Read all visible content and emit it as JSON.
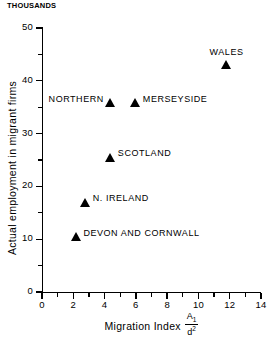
{
  "chart_data": {
    "type": "scatter",
    "title": "",
    "units_caption": "THOUSANDS",
    "xlabel": "Migration Index",
    "xlabel_formula": {
      "numerator": "A",
      "numerator_sub": "1",
      "denominator": "d",
      "denominator_sup": "2"
    },
    "ylabel": "Actual employment in migrant firms",
    "xlim": [
      0,
      14
    ],
    "ylim": [
      0,
      50
    ],
    "x_major_ticks": [
      0,
      2,
      4,
      6,
      8,
      10,
      12,
      14
    ],
    "x_minor_ticks": [
      1,
      3,
      5,
      7,
      9,
      11,
      13
    ],
    "x_tick_labels": [
      "0",
      "2",
      "4",
      "6",
      "8",
      "10",
      "12",
      "14"
    ],
    "y_major_ticks": [
      0,
      10,
      20,
      30,
      40,
      50
    ],
    "y_minor_ticks": [
      5,
      15,
      25,
      35,
      45
    ],
    "y_tick_labels": [
      "0",
      "10",
      "20",
      "30",
      "40",
      "50"
    ],
    "grid": false,
    "legend": false,
    "marker_shape": "filled-triangle",
    "marker_color": "#000000",
    "points": [
      {
        "label": "WALES",
        "x": 11.8,
        "y": 43.0,
        "label_pos": "above"
      },
      {
        "label": "NORTHERN",
        "x": 4.4,
        "y": 35.8,
        "label_pos": "left"
      },
      {
        "label": "MERSEYSIDE",
        "x": 6.0,
        "y": 35.8,
        "label_pos": "right"
      },
      {
        "label": "SCOTLAND",
        "x": 4.4,
        "y": 25.5,
        "label_pos": "right"
      },
      {
        "label": "N. IRELAND",
        "x": 2.8,
        "y": 17.0,
        "label_pos": "right"
      },
      {
        "label": "DEVON AND CORNWALL",
        "x": 2.2,
        "y": 10.5,
        "label_pos": "right"
      }
    ]
  }
}
